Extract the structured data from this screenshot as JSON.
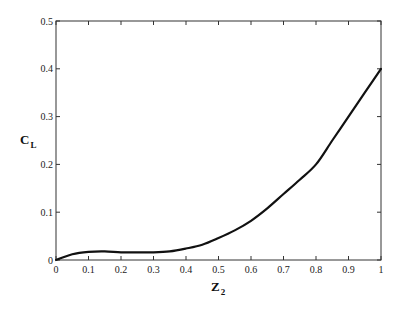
{
  "chart_data": {
    "type": "line",
    "title": "",
    "xlabel": "Z",
    "xlabel_subscript": "2",
    "ylabel": "C",
    "ylabel_subscript": "L",
    "xlim": [
      0,
      1
    ],
    "ylim": [
      0,
      0.5
    ],
    "x_ticks": [
      "0",
      "0.1",
      "0.2",
      "0.3",
      "0.4",
      "0.5",
      "0.6",
      "0.7",
      "0.8",
      "0.9",
      "1"
    ],
    "y_ticks": [
      "0",
      "0.1",
      "0.2",
      "0.3",
      "0.4",
      "0.5"
    ],
    "grid": false,
    "legend": null,
    "series": [
      {
        "name": "C_L",
        "color": "#111111",
        "x": [
          0,
          0.05,
          0.1,
          0.15,
          0.2,
          0.25,
          0.3,
          0.35,
          0.4,
          0.45,
          0.5,
          0.55,
          0.6,
          0.65,
          0.7,
          0.75,
          0.8,
          0.85,
          0.9,
          0.95,
          1.0
        ],
        "values": [
          0,
          0.012,
          0.017,
          0.018,
          0.016,
          0.016,
          0.016,
          0.018,
          0.024,
          0.032,
          0.046,
          0.062,
          0.082,
          0.108,
          0.138,
          0.168,
          0.2,
          0.25,
          0.3,
          0.35,
          0.4
        ]
      }
    ]
  }
}
